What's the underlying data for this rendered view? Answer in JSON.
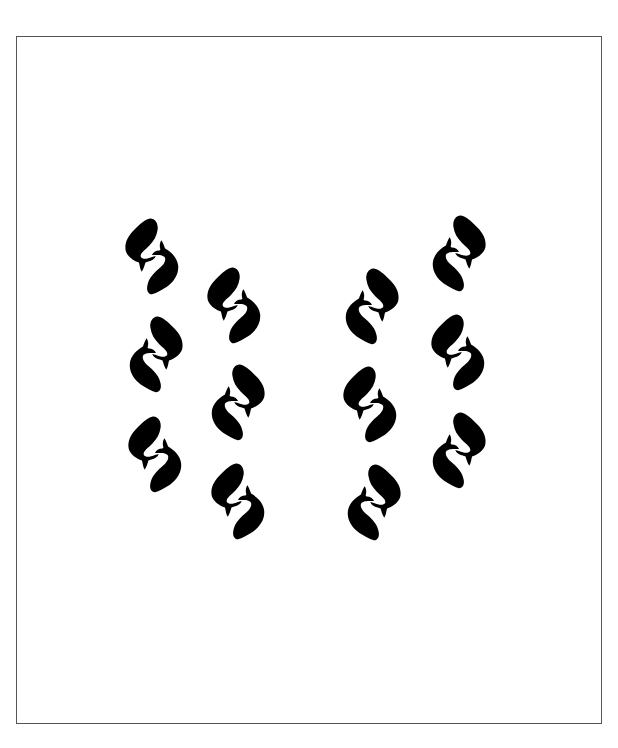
{
  "page": {
    "background": "#ffffff",
    "frame_color": "#555555",
    "motif_color": "#000000"
  },
  "pattern": {
    "description": "Twelve paired-fish motifs arranged in four columns of three",
    "motifs": [
      {
        "id": 1,
        "column": 1,
        "row": 1,
        "variant": "a",
        "x": 124,
        "y": 215
      },
      {
        "id": 2,
        "column": 1,
        "row": 2,
        "variant": "b",
        "x": 128,
        "y": 313
      },
      {
        "id": 3,
        "column": 1,
        "row": 3,
        "variant": "a",
        "x": 127,
        "y": 413
      },
      {
        "id": 4,
        "column": 2,
        "row": 1,
        "variant": "a",
        "x": 206,
        "y": 264
      },
      {
        "id": 5,
        "column": 2,
        "row": 2,
        "variant": "b",
        "x": 210,
        "y": 361
      },
      {
        "id": 6,
        "column": 2,
        "row": 3,
        "variant": "a",
        "x": 210,
        "y": 460
      },
      {
        "id": 7,
        "column": 3,
        "row": 1,
        "variant": "b",
        "x": 344,
        "y": 265
      },
      {
        "id": 8,
        "column": 3,
        "row": 2,
        "variant": "a",
        "x": 342,
        "y": 363
      },
      {
        "id": 9,
        "column": 3,
        "row": 3,
        "variant": "b",
        "x": 346,
        "y": 461
      },
      {
        "id": 10,
        "column": 4,
        "row": 1,
        "variant": "b",
        "x": 431,
        "y": 212
      },
      {
        "id": 11,
        "column": 4,
        "row": 2,
        "variant": "a",
        "x": 430,
        "y": 311
      },
      {
        "id": 12,
        "column": 4,
        "row": 3,
        "variant": "b",
        "x": 431,
        "y": 409
      }
    ]
  }
}
